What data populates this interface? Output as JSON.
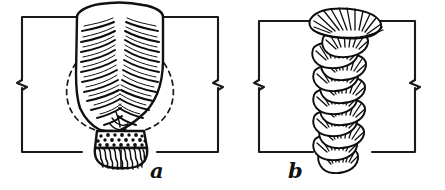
{
  "figure": {
    "background_color": "#ffffff",
    "ink_color": "#111111",
    "title": "",
    "panels": [
      {
        "id": "a",
        "label": "a",
        "label_x": 150,
        "label_y": 178,
        "caption": "Single-pass weld cross-section with coarse columnar grains",
        "plate": {
          "left_x": 22,
          "right_x": 218,
          "top_y": 17,
          "bottom_y": 152,
          "groove_left_x": 77,
          "groove_right_x": 163,
          "break_mark_y": 84
        },
        "weld": {
          "crown_peak_y": 5,
          "root_y": 166,
          "haz_dashed": true,
          "stipple_band": true,
          "grain_pattern": "herringbone-columnar"
        }
      },
      {
        "id": "b",
        "label": "b",
        "label_x": 288,
        "label_y": 178,
        "caption": "Multi-pass weld cross-section with stacked overlapping beads",
        "plate": {
          "left_x": 259,
          "right_x": 415,
          "top_y": 21,
          "bottom_y": 152,
          "groove_left_x": 318,
          "groove_right_x": 368,
          "break_mark_y": 84
        },
        "weld": {
          "crown_peak_y": 9,
          "root_y": 172,
          "haz_dashed": false,
          "stipple_band": false,
          "grain_pattern": "stacked-crescent-beads",
          "bead_count": 11
        }
      }
    ]
  }
}
